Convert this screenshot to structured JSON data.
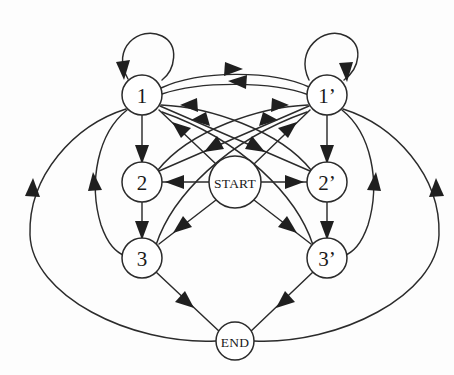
{
  "diagram": {
    "type": "directed-graph",
    "background_color": "#fdfdfd",
    "edge_color": "#2b2b2b",
    "node_fill": "#ffffff",
    "node_stroke": "#2b2b2b",
    "nodes": [
      {
        "id": "start",
        "label": "START",
        "x": 235,
        "y": 182,
        "r": 26,
        "label_style": "word"
      },
      {
        "id": "n1",
        "label": "1",
        "x": 142,
        "y": 95,
        "r": 20,
        "label_style": "num"
      },
      {
        "id": "n1p",
        "label": "1’",
        "x": 327,
        "y": 95,
        "r": 20,
        "label_style": "num"
      },
      {
        "id": "n2",
        "label": "2",
        "x": 142,
        "y": 182,
        "r": 20,
        "label_style": "num"
      },
      {
        "id": "n2p",
        "label": "2’",
        "x": 327,
        "y": 182,
        "r": 20,
        "label_style": "num"
      },
      {
        "id": "n3",
        "label": "3",
        "x": 142,
        "y": 258,
        "r": 20,
        "label_style": "num"
      },
      {
        "id": "n3p",
        "label": "3’",
        "x": 327,
        "y": 258,
        "r": 20,
        "label_style": "num"
      },
      {
        "id": "end",
        "label": "END",
        "x": 235,
        "y": 341,
        "r": 19,
        "label_style": "word"
      }
    ],
    "edges": [
      {
        "from": "n1",
        "to": "n1",
        "kind": "self-loop"
      },
      {
        "from": "n1p",
        "to": "n1p",
        "kind": "self-loop"
      },
      {
        "from": "n1",
        "to": "n1p",
        "kind": "curve"
      },
      {
        "from": "n1p",
        "to": "n1",
        "kind": "curve"
      },
      {
        "from": "n1",
        "to": "n2p",
        "kind": "straight"
      },
      {
        "from": "n1p",
        "to": "n2",
        "kind": "straight"
      },
      {
        "from": "n2",
        "to": "n1p",
        "kind": "curve"
      },
      {
        "from": "n2p",
        "to": "n1",
        "kind": "curve"
      },
      {
        "from": "n3",
        "to": "n1p",
        "kind": "curve"
      },
      {
        "from": "n3p",
        "to": "n1",
        "kind": "curve"
      },
      {
        "from": "n1",
        "to": "n2",
        "kind": "straight"
      },
      {
        "from": "n2",
        "to": "n3",
        "kind": "straight"
      },
      {
        "from": "n1p",
        "to": "n2p",
        "kind": "straight"
      },
      {
        "from": "n2p",
        "to": "n3p",
        "kind": "straight"
      },
      {
        "from": "n1",
        "to": "n3",
        "kind": "curve"
      },
      {
        "from": "n1p",
        "to": "n3p",
        "kind": "curve"
      },
      {
        "from": "n1",
        "to": "end",
        "kind": "outer-ellipse"
      },
      {
        "from": "n1p",
        "to": "end",
        "kind": "outer-ellipse"
      },
      {
        "from": "start",
        "to": "n1",
        "kind": "straight"
      },
      {
        "from": "start",
        "to": "n1p",
        "kind": "straight"
      },
      {
        "from": "start",
        "to": "n2",
        "kind": "straight"
      },
      {
        "from": "start",
        "to": "n2p",
        "kind": "straight"
      },
      {
        "from": "start",
        "to": "n3",
        "kind": "straight"
      },
      {
        "from": "start",
        "to": "n3p",
        "kind": "straight"
      },
      {
        "from": "n3",
        "to": "end",
        "kind": "straight"
      },
      {
        "from": "n3p",
        "to": "end",
        "kind": "straight"
      }
    ]
  }
}
